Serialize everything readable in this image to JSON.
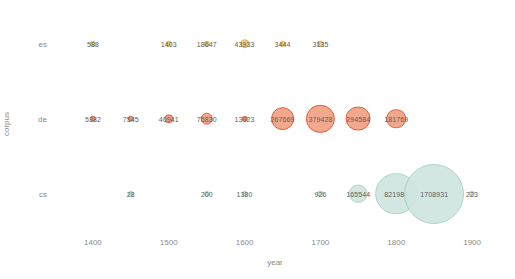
{
  "chart_data": {
    "type": "scatter",
    "title": "",
    "xlabel": "year",
    "ylabel": "corpus",
    "xlim": [
      1350,
      1950
    ],
    "ylim_categories": [
      "es",
      "de",
      "cs"
    ],
    "grid": false,
    "legend": "none",
    "xticks": [
      "1400",
      "1500",
      "1600",
      "1700",
      "1800",
      "1900"
    ],
    "xtick_values": [
      1400,
      1500,
      1600,
      1700,
      1800,
      1900
    ],
    "yticks": [
      "es",
      "de",
      "cs"
    ],
    "size_encoding": "bubble area proportional to token count",
    "series": [
      {
        "name": "es",
        "fill": "#f7cc84",
        "stroke": "#edaa3e",
        "points": [
          {
            "year": 1400,
            "value": 588,
            "label": "588"
          },
          {
            "year": 1500,
            "value": 1403,
            "label": "1403"
          },
          {
            "year": 1550,
            "value": 18647,
            "label": "18647"
          },
          {
            "year": 1600,
            "value": 43933,
            "label": "43933"
          },
          {
            "year": 1650,
            "value": 3444,
            "label": "3444"
          },
          {
            "year": 1700,
            "value": 3135,
            "label": "3135"
          }
        ]
      },
      {
        "name": "de",
        "fill": "#f0a183",
        "stroke": "#e2522c",
        "points": [
          {
            "year": 1400,
            "value": 5382,
            "label": "5382"
          },
          {
            "year": 1450,
            "value": 7545,
            "label": "7545"
          },
          {
            "year": 1500,
            "value": 40941,
            "label": "40941"
          },
          {
            "year": 1550,
            "value": 75830,
            "label": "75830"
          },
          {
            "year": 1600,
            "value": 13923,
            "label": "13923"
          },
          {
            "year": 1650,
            "value": 267669,
            "label": "267669"
          },
          {
            "year": 1700,
            "value": 379428,
            "label": "379428"
          },
          {
            "year": 1750,
            "value": 294584,
            "label": "294584"
          },
          {
            "year": 1800,
            "value": 181769,
            "label": "181769"
          }
        ]
      },
      {
        "name": "cs",
        "fill": "#cfe5df",
        "stroke": "#a9cfc6",
        "points": [
          {
            "year": 1450,
            "value": 28,
            "label": "28"
          },
          {
            "year": 1550,
            "value": 200,
            "label": "200"
          },
          {
            "year": 1600,
            "value": 1380,
            "label": "1380"
          },
          {
            "year": 1700,
            "value": 926,
            "label": "926"
          },
          {
            "year": 1750,
            "value": 165544,
            "label": "165544"
          },
          {
            "year": 1800,
            "value": 821984,
            "label": "821984"
          },
          {
            "year": 1850,
            "value": 1708931,
            "label": "1708931"
          },
          {
            "year": 1900,
            "value": 223,
            "label": "223"
          }
        ]
      }
    ]
  }
}
